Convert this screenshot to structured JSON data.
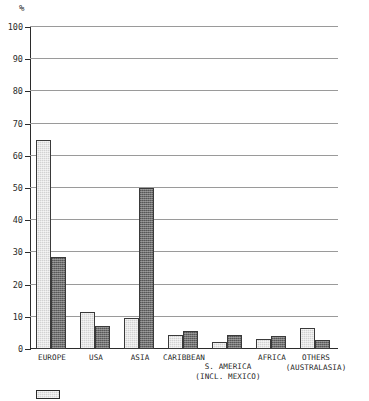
{
  "chart_data": {
    "type": "bar",
    "title": "",
    "xlabel": "",
    "ylabel": "%",
    "ylim": [
      0,
      100
    ],
    "ytick_labels": [
      "0",
      "10",
      "20",
      "30",
      "40",
      "50",
      "60",
      "70",
      "80",
      "90",
      "100"
    ],
    "ytick_values": [
      0,
      10,
      20,
      30,
      40,
      50,
      60,
      70,
      80,
      90,
      100
    ],
    "grid": true,
    "legend_position": "bottom-left",
    "categories": [
      "EUROPE",
      "USA",
      "ASIA",
      "CARIBBEAN",
      "S. AMERICA (INCL. MEXICO)",
      "AFRICA",
      "OTHERS (AUSTRALASIA)"
    ],
    "category_lines": [
      [
        "EUROPE",
        ""
      ],
      [
        "USA",
        ""
      ],
      [
        "ASIA",
        ""
      ],
      [
        "CARIBBEAN",
        ""
      ],
      [
        "S. AMERICA",
        "(INCL. MEXICO)"
      ],
      [
        "AFRICA",
        ""
      ],
      [
        "OTHERS",
        "(AUSTRALASIA)"
      ]
    ],
    "series": [
      {
        "name": "Series 1",
        "color": "#d2d2d2",
        "values": [
          65,
          11.5,
          9.7,
          4.5,
          2.3,
          3.2,
          6.5
        ]
      },
      {
        "name": "Series 2",
        "color": "#707070",
        "values": [
          28.5,
          7,
          50,
          5.5,
          4.2,
          4,
          2.8
        ]
      }
    ]
  },
  "legend": {
    "items": [
      {
        "label": "",
        "swatch": "series-light"
      }
    ]
  }
}
